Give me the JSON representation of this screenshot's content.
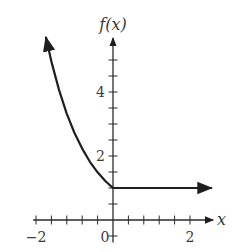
{
  "chart_data": {
    "type": "line",
    "title": "",
    "xlabel": "x",
    "ylabel": "f(x)",
    "xlim": [
      -2.05,
      2.55
    ],
    "ylim": [
      -0.7,
      5.75
    ],
    "x_ticks": [
      -2.0,
      -1.6,
      -1.2,
      -0.8,
      -0.4,
      0.4,
      0.8,
      1.2,
      1.6,
      2.0
    ],
    "x_tick_labels": [
      {
        "value": -2,
        "label": "−2"
      },
      {
        "value": 0,
        "label": "0"
      },
      {
        "value": 2,
        "label": "2"
      }
    ],
    "y_ticks": [
      -0.5,
      0.5,
      1.0,
      1.5,
      2.0,
      2.5,
      3.0,
      3.5,
      4.0,
      4.5,
      5.0
    ],
    "y_tick_labels": [
      {
        "value": 2,
        "label": "2"
      },
      {
        "value": 4,
        "label": "4"
      }
    ],
    "grid": false,
    "legend": null,
    "series": [
      {
        "name": "f(x)",
        "description": "piecewise: decreasing exponential-like curve for x <= 0, constant 1 for x >= 0; arrows at both ends",
        "x": [
          -1.74,
          -1.6,
          -1.4,
          -1.2,
          -1.0,
          -0.8,
          -0.6,
          -0.4,
          -0.2,
          0.0,
          0.5,
          1.0,
          1.5,
          2.0,
          2.55
        ],
        "values": [
          5.7,
          4.95,
          4.06,
          3.32,
          2.72,
          2.23,
          1.82,
          1.49,
          1.22,
          1.0,
          1.0,
          1.0,
          1.0,
          1.0,
          1.0
        ]
      }
    ],
    "colors": {
      "axis": "#2a2a2a",
      "curve": "#1e1e1e",
      "text": "#3a3a3a"
    }
  }
}
